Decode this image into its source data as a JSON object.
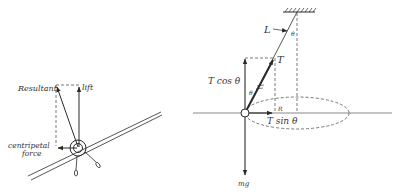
{
  "figures": [
    {
      "id": "banked-aircraft",
      "labels": {
        "resultant": "Resultant",
        "lift": "lift",
        "centripetal_line1": "centripetal",
        "centripetal_line2": "force"
      }
    },
    {
      "id": "conical-pendulum",
      "labels": {
        "length": "L",
        "theta_top": "θ",
        "tension": "T",
        "t_cos": "T cos θ",
        "theta_side": "θ",
        "radius": "R",
        "t_sin": "T sin θ",
        "weight": "mg"
      }
    }
  ],
  "colors": {
    "ink": "#2a2a2a",
    "label": "#333333",
    "axis": "#888888",
    "background": "#ffffff"
  }
}
